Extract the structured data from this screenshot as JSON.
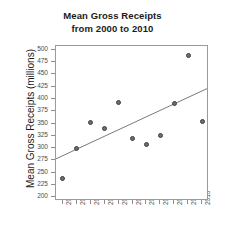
{
  "chart_data": {
    "type": "scatter",
    "title": "Mean Gross Receipts from 2000 to 2010",
    "title_lines": [
      "Mean Gross Receipts",
      "from 2000 to 2010"
    ],
    "xlabel": "",
    "ylabel": "Mean Gross Receipts (millions)",
    "x": [
      2000,
      2001,
      2002,
      2003,
      2004,
      2005,
      2006,
      2007,
      2008,
      2009,
      2010
    ],
    "values": [
      237,
      300,
      352,
      340,
      392,
      320,
      307,
      326,
      390,
      488,
      355
    ],
    "xlim": [
      1999.5,
      2010.5
    ],
    "ylim": [
      192,
      508
    ],
    "xticks": [
      "2000",
      "2001",
      "2002",
      "2003",
      "2004",
      "2005",
      "2006",
      "2007",
      "2008",
      "2009",
      "2010"
    ],
    "yticks": [
      "200",
      "225",
      "250",
      "275",
      "300",
      "325",
      "350",
      "375",
      "400",
      "425",
      "450",
      "475",
      "500"
    ],
    "ytick_values": [
      200,
      225,
      250,
      275,
      300,
      325,
      350,
      375,
      400,
      425,
      450,
      475,
      500
    ],
    "grid": false,
    "legend": "none",
    "series": [
      {
        "name": "Mean Gross Receipts",
        "marker": "filled-circle",
        "color": "#6e6e6e",
        "values": [
          237,
          300,
          352,
          340,
          392,
          320,
          307,
          326,
          390,
          488,
          355
        ]
      }
    ],
    "trendline": {
      "type": "linear-fit",
      "color": "#777777",
      "x_start": 1999.5,
      "y_start": 275,
      "x_end": 2010.5,
      "y_end": 420
    },
    "colors": {
      "marker_fill": "#6e6e6e",
      "marker_edge": "#3d3d3d",
      "axis": "#9a9a9a",
      "text": "#1b1b1b",
      "tick_text": "#4c4c4c",
      "background": "#ffffff"
    }
  }
}
